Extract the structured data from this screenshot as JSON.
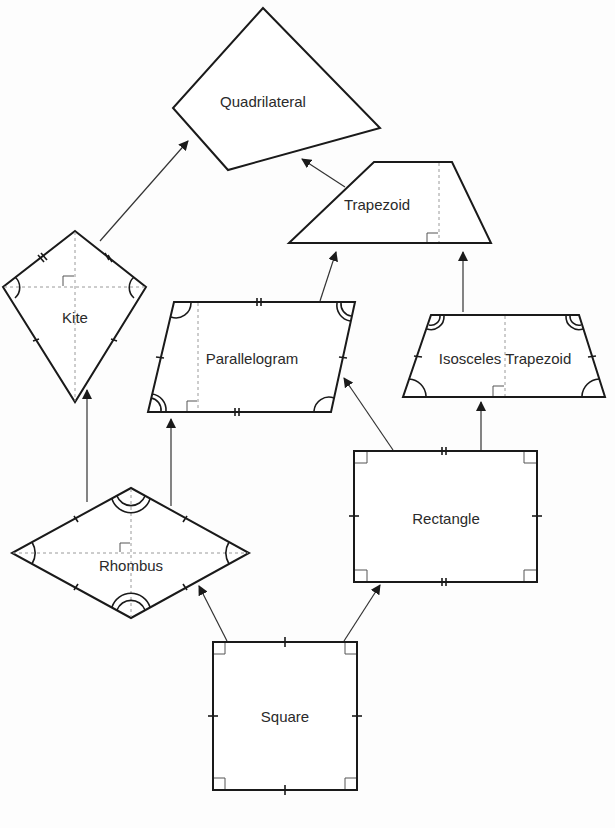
{
  "diagram": {
    "nodes": [
      {
        "id": "quadrilateral",
        "label": "Quadrilateral",
        "x": 263,
        "y": 101
      },
      {
        "id": "trapezoid",
        "label": "Trapezoid",
        "x": 377,
        "y": 204
      },
      {
        "id": "kite",
        "label": "Kite",
        "x": 75,
        "y": 317
      },
      {
        "id": "parallelogram",
        "label": "Parallelogram",
        "x": 252,
        "y": 358
      },
      {
        "id": "isosceles_trapezoid",
        "label": "Isosceles Trapezoid",
        "x": 505,
        "y": 358
      },
      {
        "id": "rectangle",
        "label": "Rectangle",
        "x": 446,
        "y": 518
      },
      {
        "id": "rhombus",
        "label": "Rhombus",
        "x": 131,
        "y": 565
      },
      {
        "id": "square",
        "label": "Square",
        "x": 285,
        "y": 716
      }
    ],
    "edges": [
      {
        "from": "kite",
        "to": "quadrilateral"
      },
      {
        "from": "trapezoid",
        "to": "quadrilateral"
      },
      {
        "from": "parallelogram",
        "to": "trapezoid"
      },
      {
        "from": "isosceles_trapezoid",
        "to": "trapezoid"
      },
      {
        "from": "rhombus",
        "to": "kite"
      },
      {
        "from": "rhombus",
        "to": "parallelogram"
      },
      {
        "from": "rectangle",
        "to": "parallelogram"
      },
      {
        "from": "rectangle",
        "to": "isosceles_trapezoid"
      },
      {
        "from": "square",
        "to": "rhombus"
      },
      {
        "from": "square",
        "to": "rectangle"
      }
    ]
  }
}
